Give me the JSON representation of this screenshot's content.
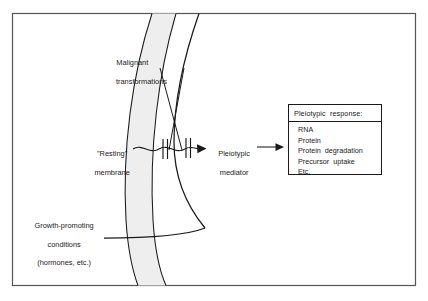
{
  "figure": {
    "kind": "schematic-diagram",
    "frame": {
      "border_color": "#555555"
    },
    "membrane_band": {
      "name": "cell-membrane-band",
      "fill_color": "#eeeeee",
      "stroke_color": "#1a1a1a"
    },
    "labels": {
      "malignant_line1": "Malignant",
      "malignant_line2": "transformations",
      "resting_line1": "\"Resting\"",
      "resting_line2": "membrane",
      "growth_line1": "Growth-promoting",
      "growth_line2": "conditions",
      "growth_line3": "(hormones, etc.)",
      "mediator_line1": "Pleiotypic",
      "mediator_line2": "mediator"
    },
    "response_box": {
      "title": "Pleiotypic  response:",
      "items": [
        "RNA",
        "Protein",
        "Protein  degradation",
        "Precursor  uptake",
        "Etc."
      ]
    }
  }
}
